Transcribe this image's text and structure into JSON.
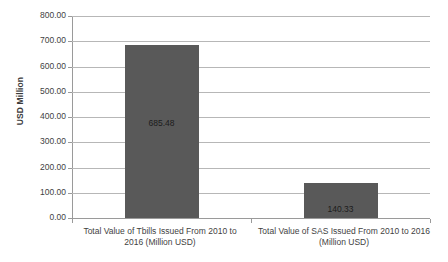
{
  "chart_data": {
    "type": "bar",
    "title": "",
    "xlabel": "",
    "ylabel": "USD Million",
    "categories": [
      "Total Value of Tbills Issued From 2010 to 2016 (Million USD)",
      "Total Value of SAS Issued From 2010 to 2016 (Million USD)"
    ],
    "values": [
      685.48,
      140.33
    ],
    "data_labels": [
      "685.48",
      "140.33"
    ],
    "ylim": [
      0,
      800
    ],
    "ytick_step": 100,
    "ytick_labels": [
      "800.00",
      "700.00",
      "600.00",
      "500.00",
      "400.00",
      "300.00",
      "200.00",
      "100.00",
      "0.00"
    ],
    "ytick_values": [
      800,
      700,
      600,
      500,
      400,
      300,
      200,
      100,
      0
    ],
    "grid": true,
    "grid_axis": "y",
    "legend": false,
    "legend_position": "none",
    "bar_color": "#595959",
    "gridline_color": "#b7b7b7",
    "axis_color": "#9a9a9a",
    "background_color": "#ffffff",
    "series": [
      {
        "name": "",
        "values": [
          685.48,
          140.33
        ]
      }
    ]
  },
  "axis": {
    "y_title": "USD Million"
  },
  "category_lines": {
    "cat0_line1": "Total Value of Tbills Issued From 2010 to",
    "cat0_line2": "2016 (Million USD)",
    "cat1_line1": "Total Value of SAS Issued From 2010 to 2016",
    "cat1_line2": "(Million USD)"
  }
}
